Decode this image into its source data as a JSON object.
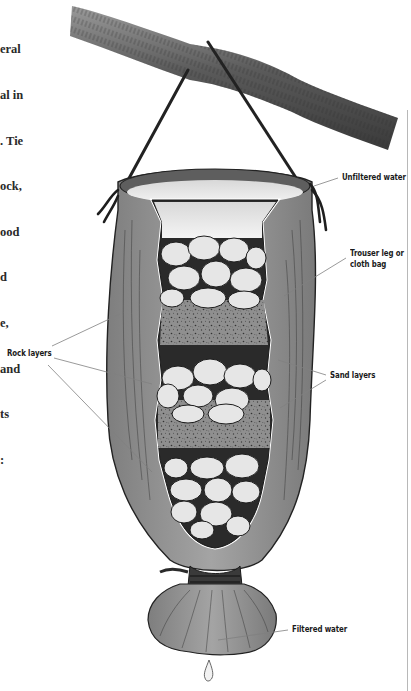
{
  "page": {
    "body_text_lines": [
      "eral",
      "al in",
      ". Tie",
      "ock,",
      "ood",
      "d",
      "e,",
      "and",
      "ts",
      ":"
    ]
  },
  "illustration": {
    "subject": "Hanging cloth-bag water filter",
    "components": {
      "branch": "tree branch",
      "hanging_cord": "rope",
      "bag": "cloth bag",
      "bottom_tie": "rope binding",
      "drip": "water droplet"
    },
    "labels": {
      "unfiltered_water": "Unfiltered water",
      "bag": [
        "Trouser leg or",
        "cloth bag"
      ],
      "rock_layers": "Rock layers",
      "sand_layers": "Sand layers",
      "filtered_water": "Filtered water"
    }
  },
  "colors": {
    "background": "#ffffff",
    "ink": "#1a1a1a",
    "cloth": "#8e8e8e",
    "cloth_dark": "#6a6a6a",
    "sand": "#9a9a9a",
    "rock": "#e6e6e6",
    "branch": "#5a5a5a",
    "leader_line": "#7a7a7a"
  }
}
